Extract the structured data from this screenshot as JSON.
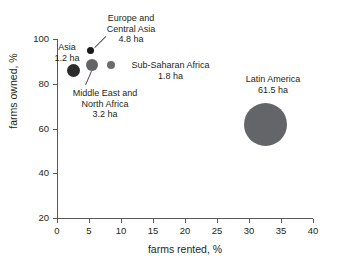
{
  "chart_data": {
    "type": "scatter",
    "title": "",
    "xlabel": "farms rented, %",
    "ylabel": "farms owned, %",
    "xlim": [
      0,
      40
    ],
    "ylim": [
      20,
      100
    ],
    "xticks": [
      "0",
      "5",
      "10",
      "15",
      "20",
      "25",
      "30",
      "35",
      "40"
    ],
    "yticks": [
      "20",
      "40",
      "60",
      "80",
      "100"
    ],
    "grid": false,
    "legend": "none",
    "size_encoding": "bubble area = average farm size in hectares (ha)",
    "points": [
      {
        "name": "Asia",
        "x": 3.4,
        "y": 86,
        "size_ha": "1.2 ha",
        "label": "Asia",
        "color": "#2b2b2b",
        "px": {
          "left": 67,
          "top": 64,
          "d": 13
        },
        "label_pos": {
          "left": 44,
          "top": 42,
          "width": 46,
          "align": "center"
        },
        "leader": null
      },
      {
        "name": "Europe and Central Asia",
        "x": 5.4,
        "y": 94,
        "size_ha": "4.8 ha",
        "label": "Europe and\nCentral Asia",
        "label_line1": "Europe and",
        "label_line2": "Central Asia",
        "color": "#1a1a1a",
        "px": {
          "left": 87,
          "top": 47,
          "d": 7
        },
        "label_pos": {
          "left": 94,
          "top": 13,
          "width": 74,
          "align": "center"
        },
        "leader": {
          "x1": 95,
          "y1": 48,
          "x2": 106,
          "y2": 37
        }
      },
      {
        "name": "Middle East and North Africa",
        "x": 6.2,
        "y": 88,
        "size_ha": "3.2 ha",
        "label": "Middle East and\nNorth Africa",
        "label_line1": "Middle East and",
        "label_line2": "North Africa",
        "color": "#636466",
        "px": {
          "left": 86,
          "top": 59,
          "d": 12
        },
        "label_pos": {
          "left": 59,
          "top": 88,
          "width": 92,
          "align": "center"
        },
        "leader": {
          "x1": 91,
          "y1": 71,
          "x2": 85,
          "y2": 85
        }
      },
      {
        "name": "Sub-Saharan Africa",
        "x": 9.0,
        "y": 88,
        "size_ha": "1.8 ha",
        "label": "Sub-Saharan Africa",
        "color": "#6b6c6e",
        "px": {
          "left": 107,
          "top": 61,
          "d": 8
        },
        "label_pos": {
          "left": 123,
          "top": 60,
          "width": 95,
          "align": "center"
        },
        "leader": null
      },
      {
        "name": "Latin America",
        "x": 33.5,
        "y": 61.5,
        "size_ha": "61.5 ha",
        "label": "Latin America",
        "color": "#646568",
        "px": {
          "left": 244,
          "top": 103,
          "d": 43
        },
        "label_pos": {
          "left": 228,
          "top": 74,
          "width": 90,
          "align": "center"
        },
        "leader": null
      }
    ]
  },
  "axis_ticks_px": {
    "y": [
      {
        "label": "100",
        "top": 39
      },
      {
        "label": "80",
        "top": 84
      },
      {
        "label": "60",
        "top": 129
      },
      {
        "label": "40",
        "top": 173
      },
      {
        "label": "20",
        "top": 218
      }
    ],
    "x": [
      {
        "label": "0",
        "left": 57
      },
      {
        "label": "5",
        "left": 89
      },
      {
        "label": "10",
        "left": 121
      },
      {
        "label": "15",
        "left": 153
      },
      {
        "label": "20",
        "left": 185
      },
      {
        "label": "25",
        "left": 217
      },
      {
        "label": "30",
        "left": 249
      },
      {
        "label": "35",
        "left": 281
      },
      {
        "label": "40",
        "left": 313
      }
    ]
  }
}
